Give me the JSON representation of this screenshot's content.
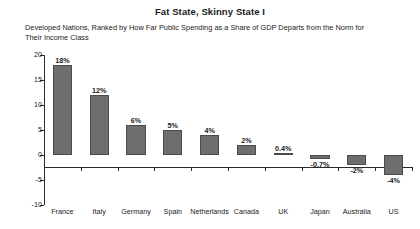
{
  "chart_data": {
    "type": "bar",
    "title": "Fat State, Skinny State I",
    "subtitle": "Developed Nations, Ranked by How Far Public Spending as a Share of GDP Departs from the Norm for Their Income Class",
    "xlabel": "",
    "ylabel": "",
    "ylim": [
      -10,
      20
    ],
    "yticks": [
      20,
      15,
      10,
      5,
      0,
      -5,
      -10
    ],
    "ytick_labels": [
      "20",
      "15",
      "10",
      "5",
      "0",
      "-5",
      "-10"
    ],
    "grid": false,
    "legend": "none",
    "categories": [
      "France",
      "Italy",
      "Germany",
      "Spain",
      "Netherlands",
      "Canada",
      "UK",
      "Japan",
      "Australia",
      "US"
    ],
    "values": [
      18,
      12,
      6,
      5,
      4,
      2,
      0.4,
      -0.7,
      -2,
      -4
    ],
    "data_labels": [
      "18%",
      "12%",
      "6%",
      "5%",
      "4%",
      "2%",
      "0.4%",
      "-0.7%",
      "-2%",
      "-4%"
    ],
    "bar_color": "#6e6e6e",
    "axis_color": "#2b2b2b",
    "background_color": "#ffffff"
  }
}
